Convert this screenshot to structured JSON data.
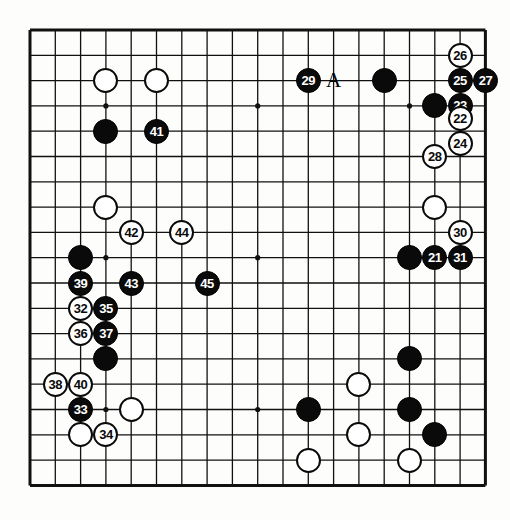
{
  "diagram": {
    "kind": "go-board-diagram",
    "board_size": 19,
    "move_number_range": "21-45",
    "colors": {
      "line": "#111111",
      "black_stone": "#0a0a0a",
      "white_stone": "#ffffff",
      "board_background": "#fdfdfb",
      "black_label_text": "#ffffff",
      "white_label_text": "#0a0a0a"
    },
    "geometry": {
      "origin_x": 30,
      "origin_y": 30,
      "spacing": 25.3,
      "stone_diameter": 25,
      "border_width": 3
    },
    "star_points": [
      {
        "col": 3,
        "row": 3
      },
      {
        "col": 9,
        "row": 3
      },
      {
        "col": 15,
        "row": 3
      },
      {
        "col": 3,
        "row": 9
      },
      {
        "col": 9,
        "row": 9
      },
      {
        "col": 15,
        "row": 9
      },
      {
        "col": 3,
        "row": 15
      },
      {
        "col": 9,
        "row": 15
      },
      {
        "col": 15,
        "row": 15
      }
    ],
    "letter_markers": [
      {
        "text": "A",
        "col": 12,
        "row": 2
      }
    ],
    "stones": [
      {
        "col": 3,
        "row": 2,
        "color": "white",
        "label": ""
      },
      {
        "col": 5,
        "row": 2,
        "color": "white",
        "label": ""
      },
      {
        "col": 14,
        "row": 2,
        "color": "black",
        "label": ""
      },
      {
        "col": 11,
        "row": 2,
        "color": "black",
        "label": "29"
      },
      {
        "col": 17,
        "row": 1,
        "color": "white",
        "label": "26"
      },
      {
        "col": 17,
        "row": 2,
        "color": "black",
        "label": "25"
      },
      {
        "col": 18,
        "row": 2,
        "color": "black",
        "label": "27"
      },
      {
        "col": 16,
        "row": 3,
        "color": "black",
        "label": ""
      },
      {
        "col": 17,
        "row": 3,
        "color": "black",
        "label": "23"
      },
      {
        "col": 17,
        "row": 3.5,
        "color": "white",
        "label": "22"
      },
      {
        "col": 17,
        "row": 4.5,
        "color": "white",
        "label": "24"
      },
      {
        "col": 3,
        "row": 4,
        "color": "black",
        "label": ""
      },
      {
        "col": 5,
        "row": 4,
        "color": "black",
        "label": "41"
      },
      {
        "col": 16,
        "row": 5,
        "color": "white",
        "label": "28"
      },
      {
        "col": 3,
        "row": 7,
        "color": "white",
        "label": ""
      },
      {
        "col": 16,
        "row": 7,
        "color": "white",
        "label": ""
      },
      {
        "col": 4,
        "row": 8,
        "color": "white",
        "label": "42"
      },
      {
        "col": 6,
        "row": 8,
        "color": "white",
        "label": "44"
      },
      {
        "col": 17,
        "row": 8,
        "color": "white",
        "label": "30"
      },
      {
        "col": 2,
        "row": 9,
        "color": "black",
        "label": ""
      },
      {
        "col": 15,
        "row": 9,
        "color": "black",
        "label": ""
      },
      {
        "col": 16,
        "row": 9,
        "color": "black",
        "label": "21"
      },
      {
        "col": 17,
        "row": 9,
        "color": "black",
        "label": "31"
      },
      {
        "col": 2,
        "row": 10,
        "color": "black",
        "label": "39"
      },
      {
        "col": 4,
        "row": 10,
        "color": "black",
        "label": "43"
      },
      {
        "col": 7,
        "row": 10,
        "color": "black",
        "label": "45"
      },
      {
        "col": 2,
        "row": 11,
        "color": "white",
        "label": "32"
      },
      {
        "col": 3,
        "row": 11,
        "color": "black",
        "label": "35"
      },
      {
        "col": 2,
        "row": 12,
        "color": "white",
        "label": "36"
      },
      {
        "col": 3,
        "row": 12,
        "color": "black",
        "label": "37"
      },
      {
        "col": 3,
        "row": 13,
        "color": "black",
        "label": ""
      },
      {
        "col": 15,
        "row": 13,
        "color": "black",
        "label": ""
      },
      {
        "col": 1,
        "row": 14,
        "color": "white",
        "label": "38"
      },
      {
        "col": 2,
        "row": 14,
        "color": "white",
        "label": "40"
      },
      {
        "col": 13,
        "row": 14,
        "color": "white",
        "label": ""
      },
      {
        "col": 2,
        "row": 15,
        "color": "black",
        "label": "33"
      },
      {
        "col": 4,
        "row": 15,
        "color": "white",
        "label": ""
      },
      {
        "col": 11,
        "row": 15,
        "color": "black",
        "label": ""
      },
      {
        "col": 15,
        "row": 15,
        "color": "black",
        "label": ""
      },
      {
        "col": 2,
        "row": 16,
        "color": "white",
        "label": ""
      },
      {
        "col": 3,
        "row": 16,
        "color": "white",
        "label": "34"
      },
      {
        "col": 13,
        "row": 16,
        "color": "white",
        "label": ""
      },
      {
        "col": 16,
        "row": 16,
        "color": "black",
        "label": ""
      },
      {
        "col": 11,
        "row": 17,
        "color": "white",
        "label": ""
      },
      {
        "col": 15,
        "row": 17,
        "color": "white",
        "label": ""
      }
    ]
  }
}
